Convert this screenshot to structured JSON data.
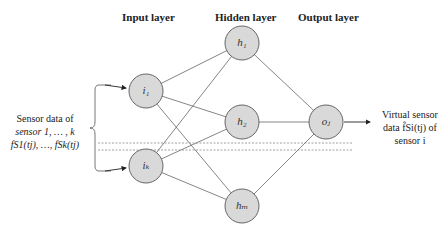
{
  "layers": {
    "input": "Input layer",
    "hidden": "Hidden layer",
    "output": "Output layer"
  },
  "nodes": {
    "i1": "i₁",
    "ik": "iₖ",
    "h1": "h₁",
    "h2": "h₂",
    "hm": "hₘ",
    "oj": "oⱼ"
  },
  "left_label": {
    "line1": "Sensor data of",
    "line2": "sensor 1, … , k",
    "line3": "fS1(tj), …, fSk(tj)"
  },
  "right_label": {
    "line1": "Virtual sensor",
    "line2": "data f̂Si(tj) of",
    "line3": "sensor i"
  },
  "colors": {
    "node_fill": "#d9d9d9",
    "node_stroke": "#666666",
    "edge": "#555555"
  }
}
